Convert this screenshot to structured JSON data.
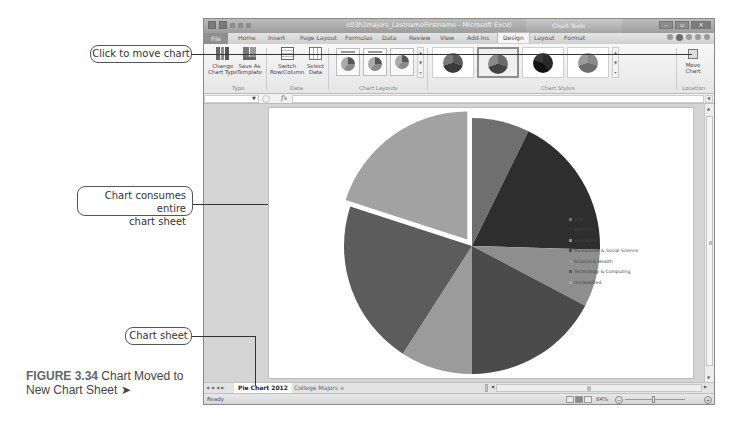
{
  "window": {
    "title": "e03h2majors_LastnameFirstname - Microsoft Excel",
    "context_tab_group": "Chart Tools",
    "controls": [
      "minimize",
      "restore",
      "close"
    ]
  },
  "ribbon_tabs": [
    {
      "label": "File",
      "active": false
    },
    {
      "label": "Home",
      "active": false
    },
    {
      "label": "Insert",
      "active": false
    },
    {
      "label": "Page Layout",
      "active": false
    },
    {
      "label": "Formulas",
      "active": false
    },
    {
      "label": "Data",
      "active": false
    },
    {
      "label": "Review",
      "active": false
    },
    {
      "label": "View",
      "active": false
    },
    {
      "label": "Add-Ins",
      "active": false
    },
    {
      "label": "Design",
      "active": true
    },
    {
      "label": "Layout",
      "active": false
    },
    {
      "label": "Format",
      "active": false
    }
  ],
  "ribbon": {
    "type_group": {
      "label": "Type",
      "change_chart_type": "Change Chart Type",
      "change_chart_type_l1": "Change",
      "change_chart_type_l2": "Chart Type",
      "save_as_template_l1": "Save As",
      "save_as_template_l2": "Template"
    },
    "data_group": {
      "label": "Data",
      "switch_l1": "Switch",
      "switch_l2": "Row/Column",
      "select_l1": "Select",
      "select_l2": "Data"
    },
    "chart_layouts_group": {
      "label": "Chart Layouts",
      "count": 3
    },
    "chart_styles_group": {
      "label": "Chart Styles",
      "count": 4,
      "selected_index": 1
    },
    "location_group": {
      "label": "Location",
      "move_chart_l1": "Move",
      "move_chart_l2": "Chart"
    }
  },
  "formula_bar": {
    "name_box": "",
    "fx_label": "fx",
    "formula": ""
  },
  "chart_data": {
    "type": "pie",
    "title": "",
    "exploded_slice": "Unclassified",
    "categories": [
      "Arts",
      "Business",
      "Education",
      "Humanities & Social Science",
      "Science & Health",
      "Technology & Computing",
      "Unclassified"
    ],
    "values": [
      8,
      20,
      8,
      19,
      10,
      23,
      22
    ],
    "colors": [
      "#6f6f6f",
      "#2e2e2e",
      "#8e8e8e",
      "#4b4b4b",
      "#9b9b9b",
      "#5c5c5c",
      "#a2a2a2"
    ],
    "legend_position": "right"
  },
  "legend": {
    "items": [
      {
        "label": "Arts",
        "color": "#6f6f6f"
      },
      {
        "label": "Business",
        "color": "#2e2e2e"
      },
      {
        "label": "Education",
        "color": "#8e8e8e"
      },
      {
        "label": "Humanities & Social Science",
        "color": "#4b4b4b"
      },
      {
        "label": "Science & Health",
        "color": "#9b9b9b"
      },
      {
        "label": "Technology & Computing",
        "color": "#5c5c5c"
      },
      {
        "label": "Unclassified",
        "color": "#a2a2a2"
      }
    ]
  },
  "sheet_tabs": {
    "active": "Pie Chart 2012",
    "other": "College Majors",
    "new_sheet_icon": "insert-worksheet"
  },
  "status_bar": {
    "status": "Ready",
    "zoom_level": "84%",
    "zoom_minus": "−",
    "zoom_plus": "+"
  },
  "callouts": {
    "move_chart": "Click to move chart",
    "chart_consumes_l1": "Chart consumes entire",
    "chart_consumes_l2": "chart sheet",
    "chart_sheet": "Chart sheet"
  },
  "figure_caption": {
    "number": "FIGURE 3.34",
    "text_l1": " Chart Moved to",
    "text_l2": "New Chart Sheet ➤"
  }
}
